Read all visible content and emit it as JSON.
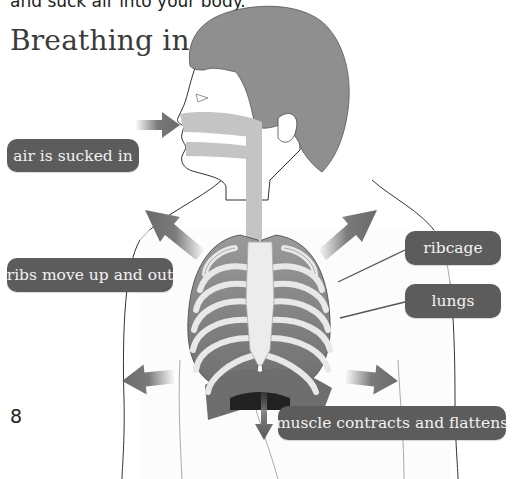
{
  "page": {
    "intro_text": "and suck air into your body.",
    "heading": "Breathing in",
    "page_number": "8"
  },
  "labels": {
    "air": "air is sucked in",
    "ribs": "ribs move up and out",
    "ribcage": "ribcage",
    "lungs": "lungs",
    "muscle": "muscle contracts and flattens"
  },
  "colors": {
    "label_bg": "#5c5c5c",
    "label_text": "#f2f2f2",
    "hair": "#8f8f8f",
    "airway": "#c4c4c4",
    "bone": "#e6e6e6",
    "lung": "#8a8a8a",
    "diaphragm": "#6e6e6e",
    "arrow": "#7a7a7a"
  }
}
